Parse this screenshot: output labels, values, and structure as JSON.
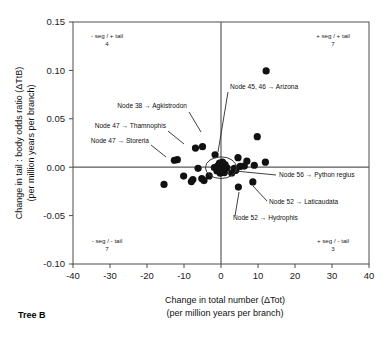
{
  "figure": {
    "panel_label": "Tree B",
    "arrow_glyph": "→"
  },
  "chart_data": {
    "type": "scatter",
    "title": "",
    "xlabel_line1": "Change in total number (ΔTot)",
    "xlabel_line2": "(per million years per branch)",
    "ylabel_line1": "Change in tail : body odds ratio (ΔTtB)",
    "ylabel_line2": "(per million years per branch)",
    "xlim": [
      -40,
      40
    ],
    "ylim": [
      -0.1,
      0.15
    ],
    "xticks": [
      -40,
      -30,
      -20,
      -10,
      0,
      10,
      20,
      30,
      40
    ],
    "xticklabels": [
      "-40",
      "-30",
      "-20",
      "-10",
      "0",
      "10",
      "20",
      "30",
      "40"
    ],
    "yticks": [
      -0.1,
      -0.05,
      0.0,
      0.05,
      0.1,
      0.15
    ],
    "yticklabels": [
      "-0.10",
      "-0.05",
      "0.00",
      "0.05",
      "0.10",
      "0.15"
    ],
    "grid": false,
    "legend": "none",
    "zero_lines": true,
    "points": [
      {
        "x": 12.2,
        "y": 0.0995
      },
      {
        "x": 9.8,
        "y": 0.0315
      },
      {
        "x": -5.0,
        "y": 0.0212
      },
      {
        "x": -6.9,
        "y": 0.0198
      },
      {
        "x": -11.8,
        "y": 0.0078
      },
      {
        "x": -12.6,
        "y": 0.0072
      },
      {
        "x": -1.6,
        "y": 0.0128
      },
      {
        "x": 4.6,
        "y": 0.0098
      },
      {
        "x": 7.0,
        "y": 0.0062
      },
      {
        "x": 12.0,
        "y": 0.0052
      },
      {
        "x": 9.0,
        "y": 0.002
      },
      {
        "x": 6.3,
        "y": 0.0012
      },
      {
        "x": 5.2,
        "y": 0.0008
      },
      {
        "x": 3.6,
        "y": -0.0012
      },
      {
        "x": 4.0,
        "y": -0.0032
      },
      {
        "x": 2.9,
        "y": -0.006
      },
      {
        "x": -6.2,
        "y": -0.0012
      },
      {
        "x": -10.1,
        "y": -0.0092
      },
      {
        "x": -15.4,
        "y": -0.0178
      },
      {
        "x": -7.6,
        "y": -0.0128
      },
      {
        "x": -8.0,
        "y": -0.0148
      },
      {
        "x": -5.2,
        "y": -0.0118
      },
      {
        "x": -4.6,
        "y": -0.0138
      },
      {
        "x": -3.2,
        "y": -0.009
      },
      {
        "x": 4.7,
        "y": -0.0205
      },
      {
        "x": 8.6,
        "y": -0.0152
      },
      {
        "x": -0.4,
        "y": 0.0042
      },
      {
        "x": -1.1,
        "y": -0.0038
      },
      {
        "x": 0.6,
        "y": -0.0022
      },
      {
        "x": 0.2,
        "y": 0.001
      },
      {
        "x": 1.1,
        "y": 0.0028
      },
      {
        "x": -0.8,
        "y": 0.0016
      },
      {
        "x": 0.9,
        "y": -0.0056
      },
      {
        "x": -1.8,
        "y": -0.0004
      },
      {
        "x": 1.6,
        "y": -0.0006
      },
      {
        "x": 0.0,
        "y": -0.003
      },
      {
        "x": 0.4,
        "y": 0.0052
      },
      {
        "x": -0.2,
        "y": -0.0062
      }
    ],
    "cluster_marker": {
      "label": "origin-cluster-circle",
      "cx": 0.0,
      "cy": -0.0005,
      "r_x": 4.2,
      "r_y": 0.0112
    },
    "quadrant_labels": [
      {
        "name": "top-left",
        "text": "- seg / + tail",
        "count": "4"
      },
      {
        "name": "top-right",
        "text": "+ seg / + tail",
        "count": "7"
      },
      {
        "name": "bottom-left",
        "text": "- seg / - tail",
        "count": "7"
      },
      {
        "name": "bottom-right",
        "text": "+ seg / - tail",
        "count": "3"
      }
    ],
    "annotations": [
      {
        "name": "annot-arizona",
        "text": "Node 45, 46 → Arizona",
        "target": {
          "x": -0.9,
          "y": 0.0145
        }
      },
      {
        "name": "annot-agkistrodon",
        "text": "Node 38 → Agkistrodon",
        "target": {
          "x": -5.0,
          "y": 0.0212
        }
      },
      {
        "name": "annot-thamnophis",
        "text": "Node 47 → Thamnophis",
        "target": {
          "x": -6.9,
          "y": 0.0198
        }
      },
      {
        "name": "annot-storeria",
        "text": "Node 47 → Storeria",
        "target": {
          "x": -12.2,
          "y": 0.0075
        }
      },
      {
        "name": "annot-python-regius",
        "text": "Node 56 → Python regius",
        "target": {
          "x": 3.4,
          "y": -0.0042
        }
      },
      {
        "name": "annot-laticaudata",
        "text": "Node 52 → Laticaudata",
        "target": {
          "x": 8.6,
          "y": -0.0152
        }
      },
      {
        "name": "annot-hydrophis",
        "text": "Node 52 → Hydrophis",
        "target": {
          "x": 4.7,
          "y": -0.0205
        }
      }
    ]
  }
}
